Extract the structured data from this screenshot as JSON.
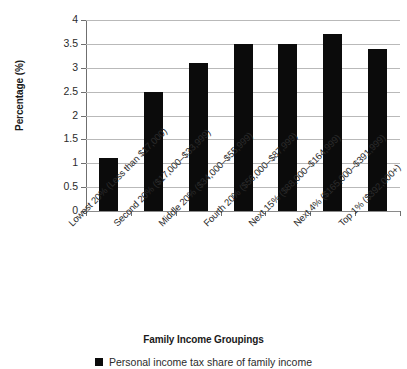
{
  "chart_data": {
    "type": "bar",
    "title": "",
    "subtitle": "",
    "xlabel": "Family Income Groupings",
    "ylabel": "Percentage (%)",
    "ylim": [
      0,
      4
    ],
    "ytick_step": 0.5,
    "yticks": [
      "4",
      "3.5",
      "3",
      "2.5",
      "2",
      "1.5",
      "1",
      "0.5",
      "0"
    ],
    "ytick_values": [
      4,
      3.5,
      3,
      2.5,
      2,
      1.5,
      1,
      0.5,
      0
    ],
    "grid": "horizontal",
    "legend_position": "bottom-center",
    "bar_color": "#0b0b0b",
    "gridline_color": "#b9b9b9",
    "background_color": "#ffffff",
    "categories": [
      "Lowest 20% (Less than $17,000)",
      "Second 20% ($17,000–$33,999)",
      "Middle 20% ($34,000–$55,999)",
      "Fourth 20% ($56,000–$87,999)",
      "Next 15% ($88,000–$164,999)",
      "Next 4% ($165,000–$391,999)",
      "Top 1% ($392,000+)"
    ],
    "values": [
      1.1,
      2.5,
      3.1,
      3.5,
      3.5,
      3.7,
      3.4
    ],
    "series": [
      {
        "name": "Personal income tax share of family income",
        "values": [
          1.1,
          2.5,
          3.1,
          3.5,
          3.5,
          3.7,
          3.4
        ]
      }
    ],
    "legend": [
      "Personal income tax share of family income"
    ]
  },
  "legend": {
    "entries": [
      {
        "label": "Personal income tax share of family income",
        "color": "#0b0b0b",
        "marker": "square"
      }
    ]
  },
  "axes": {
    "y_title": "Percentage (%)",
    "x_title": "Family Income Groupings"
  }
}
